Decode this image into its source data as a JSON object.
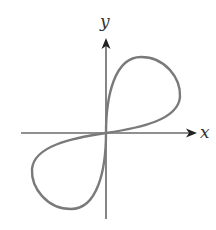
{
  "figure": {
    "axes": {
      "x_label": "x",
      "y_label": "y",
      "origin_px": [
        106,
        133
      ],
      "x_axis_px": {
        "from": 21,
        "to": 196
      },
      "y_axis_px": {
        "from": 219,
        "to": 39
      },
      "color": "#222222"
    },
    "curve": {
      "color": "#7a7a7a",
      "stroke_width": 2.4,
      "upper_lobe_path": "M106,133 C106,95 115,57 141,57 C165,57 181,78 180,97 C178,120 140,128 106,133 Z",
      "lower_lobe_path": "M106,133 C106,171 97,209 71,209 C47,209 31,188 32,169 C34,146 72,138 106,133 Z"
    }
  }
}
